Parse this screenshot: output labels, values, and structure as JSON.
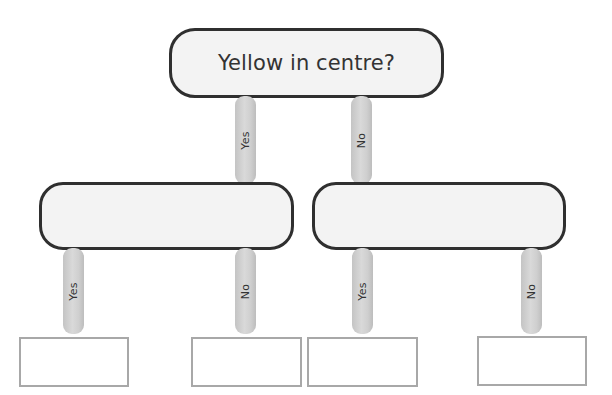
{
  "diagram": {
    "type": "decision-tree",
    "root": {
      "question": "Yellow in centre?"
    },
    "level1_connectors": [
      {
        "label": "Yes"
      },
      {
        "label": "No"
      }
    ],
    "level1_nodes": [
      {
        "text": ""
      },
      {
        "text": ""
      }
    ],
    "level2_connectors": [
      {
        "label": "Yes"
      },
      {
        "label": "No"
      },
      {
        "label": "Yes"
      },
      {
        "label": "No"
      }
    ],
    "leaves": [
      {
        "text": ""
      },
      {
        "text": ""
      },
      {
        "text": ""
      },
      {
        "text": ""
      }
    ],
    "colors": {
      "node_border": "#2f2f2f",
      "node_fill": "#f3f3f3",
      "connector_fill": "#d0d0d0",
      "leaf_border": "#a8a8a8",
      "text": "#333333"
    }
  }
}
